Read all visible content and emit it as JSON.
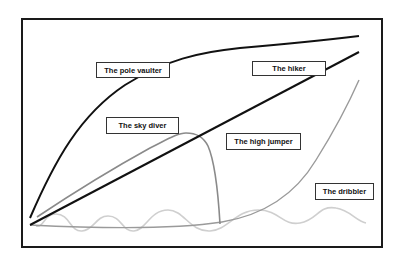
{
  "diagram": {
    "title": "",
    "labels": [
      {
        "id": "pole-vaulter",
        "text": "The pole vaulter",
        "box": [
          96,
          62,
          74,
          16
        ]
      },
      {
        "id": "hiker",
        "text": "The hiker",
        "box": [
          252,
          61,
          74,
          15
        ]
      },
      {
        "id": "sky-diver",
        "text": "The sky diver",
        "box": [
          106,
          117,
          73,
          17
        ]
      },
      {
        "id": "high-jumper",
        "text": "The high jumper",
        "box": [
          226,
          133,
          75,
          17
        ]
      },
      {
        "id": "dribbler",
        "text": "The dribbler",
        "box": [
          315,
          183,
          59,
          17
        ]
      }
    ],
    "curves": [
      {
        "id": "pole-vaulter",
        "color": "#111111",
        "style": "solid",
        "width": 2
      },
      {
        "id": "hiker",
        "color": "#111111",
        "style": "solid",
        "width": 2
      },
      {
        "id": "sky-diver",
        "color": "#8a8a8a",
        "style": "solid",
        "width": 1.6
      },
      {
        "id": "high-jumper",
        "color": "#9a9a9a",
        "style": "solid",
        "width": 1.4
      },
      {
        "id": "dribbler",
        "color": "#cfcfcf",
        "style": "solid",
        "width": 1.6
      }
    ]
  }
}
